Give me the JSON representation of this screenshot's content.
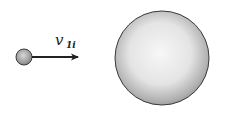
{
  "diagram": {
    "title": "",
    "small_ball": {
      "cx": 24,
      "cy": 57,
      "r": 8
    },
    "large_ball": {
      "cx": 162,
      "cy": 58,
      "r": 47
    },
    "velocity_arrow": {
      "x1": 33,
      "y1": 57,
      "x2": 79,
      "y2": 57
    },
    "velocity_label": {
      "main": "v",
      "subscript": "1i"
    },
    "colors": {
      "background": "#ffffff",
      "outline": "#3a3a3a",
      "arrow": "#222222",
      "shade_light": "#f5f5f5",
      "shade_dark": "#8a8a8a"
    }
  }
}
